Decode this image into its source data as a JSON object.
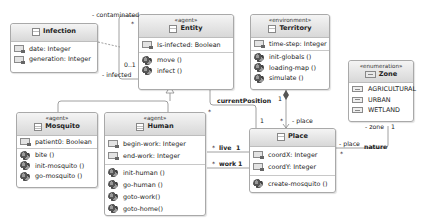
{
  "classes": {
    "infection": {
      "stereotype": "",
      "name": "Infection",
      "attributes": [
        "date: Integer",
        "generation: Integer"
      ],
      "operations": []
    },
    "entity": {
      "stereotype": "«agent»",
      "name": "Entity",
      "attributes": [
        "Is-infected: Boolean"
      ],
      "operations": [
        "move ()",
        "infect ()"
      ]
    },
    "territory": {
      "stereotype": "«environment»",
      "name": "Territory",
      "attributes": [
        "time-step: Integer"
      ],
      "operations": [
        "init-globals ()",
        "loading-map ()",
        "simulate ()"
      ]
    },
    "zone": {
      "stereotype": "«enumeration»",
      "name": "Zone",
      "literals": [
        "AGRICULTURAL",
        "URBAN",
        "WETLAND"
      ]
    },
    "mosquito": {
      "stereotype": "«agent»",
      "name": "Mosquito",
      "attributes": [
        "patient0: Boolean"
      ],
      "operations": [
        "bite ()",
        "init-mosquito ()",
        "go-mosquito ()"
      ]
    },
    "human": {
      "stereotype": "«agent»",
      "name": "Human",
      "attributes": [
        "begin-work: Integer",
        "end-work: Integer"
      ],
      "operations": [
        "init-human ()",
        "go-human ()",
        "goto-work()",
        "goto-home()"
      ]
    },
    "place": {
      "stereotype": "",
      "name": "Place",
      "attributes": [
        "coordX: Integer",
        "coordY: Integer"
      ],
      "operations": [
        "create-mosquito ()"
      ]
    }
  },
  "associations": {
    "contaminated": "- contaminated",
    "contaminated_mult": "*",
    "infected": "- infected",
    "infected_mult": "0..1",
    "current_position": "currentPosition",
    "current_position_mult_entity": "*",
    "current_position_mult_place": "1",
    "live": "live",
    "live_mult_human": "*",
    "live_mult_place": "1",
    "work": "work",
    "work_mult_human": "*",
    "work_mult_place": "1",
    "territory_mult": "1",
    "place_role": "- place",
    "place_mult": "*",
    "zone_role": "- zone",
    "zone_mult": "1",
    "nature": "nature",
    "nature_place_role": "- place",
    "nature_place_mult": "*"
  }
}
